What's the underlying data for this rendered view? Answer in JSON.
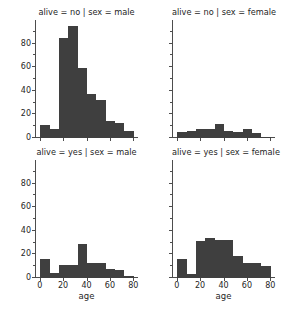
{
  "figure": {
    "kind": "facet-grid-histograms",
    "bar_color": "#3f3f3f",
    "axis_color": "#4d4d4d",
    "background": "#ffffff",
    "xlabel": "age"
  },
  "axes": {
    "x_ticks": [
      "0",
      "20",
      "40",
      "60",
      "80"
    ],
    "x_tick_values": [
      0,
      20,
      40,
      60,
      80
    ],
    "y_ticks": [
      "0",
      "20",
      "40",
      "60",
      "80"
    ],
    "y_tick_values": [
      0,
      20,
      40,
      60,
      80
    ],
    "xlim": [
      -4,
      84
    ],
    "ylim": [
      0,
      100
    ]
  },
  "panels": [
    {
      "id": "alive-no-male",
      "title": "alive = no | sex = male",
      "row": 0,
      "col": 0,
      "show_ylabels": true,
      "show_xlabels": false,
      "show_xlabel_title": false
    },
    {
      "id": "alive-no-female",
      "title": "alive = no | sex = female",
      "row": 0,
      "col": 1,
      "show_ylabels": false,
      "show_xlabels": false,
      "show_xlabel_title": false
    },
    {
      "id": "alive-yes-male",
      "title": "alive = yes | sex = male",
      "row": 1,
      "col": 0,
      "show_ylabels": true,
      "show_xlabels": true,
      "show_xlabel_title": true
    },
    {
      "id": "alive-yes-female",
      "title": "alive = yes | sex = female",
      "row": 1,
      "col": 1,
      "show_ylabels": false,
      "show_xlabels": true,
      "show_xlabel_title": true
    }
  ],
  "chart_data": {
    "type": "bar",
    "title": "",
    "xlabel": "age",
    "ylabel": "",
    "xlim": [
      -4,
      84
    ],
    "ylim": [
      0,
      100
    ],
    "grid": false,
    "legend": "none",
    "bin_edges": [
      0.4,
      8.4,
      16.4,
      24.4,
      32.4,
      40.4,
      48.4,
      56.4,
      64.4,
      72.4,
      80.4
    ],
    "bin_centers": [
      4.4,
      12.4,
      20.4,
      28.4,
      36.4,
      44.4,
      52.4,
      60.4,
      68.4,
      76.4
    ],
    "facets": [
      {
        "name": "alive = no | sex = male",
        "alive": "no",
        "sex": "male",
        "values": [
          11,
          8,
          85,
          95,
          59,
          37,
          32,
          14,
          13,
          6
        ],
        "xlabels": [
          "0",
          "20",
          "40",
          "60",
          "80"
        ],
        "ylabels": [
          "0",
          "20",
          "40",
          "60",
          "80"
        ]
      },
      {
        "name": "alive = no | sex = female",
        "alive": "no",
        "sex": "female",
        "values": [
          5,
          6,
          8,
          8,
          12,
          6,
          5,
          8,
          4,
          1
        ],
        "xlabels": [
          "0",
          "20",
          "40",
          "60",
          "80"
        ],
        "ylabels": [
          "0",
          "20",
          "40",
          "60",
          "80"
        ]
      },
      {
        "name": "alive = yes | sex = male",
        "alive": "yes",
        "sex": "male",
        "values": [
          16,
          4,
          11,
          11,
          29,
          13,
          13,
          8,
          7,
          2
        ],
        "extra_bars": [
          {
            "center": 76.4,
            "value": 1
          }
        ],
        "xlabels": [
          "0",
          "20",
          "40",
          "60",
          "80"
        ],
        "ylabels": [
          "0",
          "20",
          "40",
          "60",
          "80"
        ]
      },
      {
        "name": "alive = yes | sex = female",
        "alive": "yes",
        "sex": "female",
        "values": [
          16,
          3,
          31,
          34,
          32,
          32,
          19,
          13,
          13,
          10
        ],
        "xlabels": [
          "0",
          "20",
          "40",
          "60",
          "80"
        ],
        "ylabels": [
          "0",
          "20",
          "40",
          "60",
          "80"
        ]
      }
    ]
  }
}
